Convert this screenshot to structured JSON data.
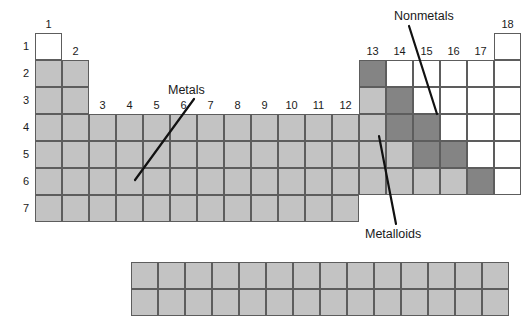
{
  "diagram": {
    "colors": {
      "metal": "#c3c3c3",
      "metalloid": "#848484",
      "nonmetal": "#ffffff",
      "cell_border": "#5d5d5d",
      "leader_line": "#111111",
      "text": "#1a1a1a",
      "background": "#ffffff"
    }
  },
  "geometry": {
    "cell_size": 27,
    "origin_x": 35,
    "origin_y": 33,
    "fblock_origin_x": 131,
    "fblock_origin_y": 262,
    "fblock_columns": 14,
    "fblock_rows": 2
  },
  "group_labels": [
    "1",
    "2",
    "3",
    "4",
    "5",
    "6",
    "7",
    "8",
    "9",
    "10",
    "11",
    "12",
    "13",
    "14",
    "15",
    "16",
    "17",
    "18"
  ],
  "period_labels": [
    "1",
    "2",
    "3",
    "4",
    "5",
    "6",
    "7"
  ],
  "callouts": [
    {
      "id": "metals",
      "label": "Metals",
      "label_x": 168,
      "label_y": 84,
      "line_x1": 194,
      "line_y1": 99,
      "line_x2": 135,
      "line_y2": 180
    },
    {
      "id": "nonmetals",
      "label": "Nonmetals",
      "label_x": 394,
      "label_y": 10,
      "line_x1": 409,
      "line_y1": 26,
      "line_x2": 437,
      "line_y2": 114
    },
    {
      "id": "metalloids",
      "label": "Metalloids",
      "label_x": 365,
      "label_y": 228,
      "line_x1": 396,
      "line_y1": 224,
      "line_x2": 379,
      "line_y2": 136
    }
  ],
  "main_grid": {
    "rows": [
      {
        "period": "1",
        "cells": [
          {
            "group": 1,
            "type": "nonmetal"
          },
          {
            "group": 18,
            "type": "nonmetal"
          }
        ]
      },
      {
        "period": "2",
        "cells": [
          {
            "group": 1,
            "type": "metal"
          },
          {
            "group": 2,
            "type": "metal"
          },
          {
            "group": 13,
            "type": "metalloid"
          },
          {
            "group": 14,
            "type": "nonmetal"
          },
          {
            "group": 15,
            "type": "nonmetal"
          },
          {
            "group": 16,
            "type": "nonmetal"
          },
          {
            "group": 17,
            "type": "nonmetal"
          },
          {
            "group": 18,
            "type": "nonmetal"
          }
        ]
      },
      {
        "period": "3",
        "cells": [
          {
            "group": 1,
            "type": "metal"
          },
          {
            "group": 2,
            "type": "metal"
          },
          {
            "group": 13,
            "type": "metal"
          },
          {
            "group": 14,
            "type": "metalloid"
          },
          {
            "group": 15,
            "type": "nonmetal"
          },
          {
            "group": 16,
            "type": "nonmetal"
          },
          {
            "group": 17,
            "type": "nonmetal"
          },
          {
            "group": 18,
            "type": "nonmetal"
          }
        ]
      },
      {
        "period": "4",
        "cells": [
          {
            "group": 1,
            "type": "metal"
          },
          {
            "group": 2,
            "type": "metal"
          },
          {
            "group": 3,
            "type": "metal"
          },
          {
            "group": 4,
            "type": "metal"
          },
          {
            "group": 5,
            "type": "metal"
          },
          {
            "group": 6,
            "type": "metal"
          },
          {
            "group": 7,
            "type": "metal"
          },
          {
            "group": 8,
            "type": "metal"
          },
          {
            "group": 9,
            "type": "metal"
          },
          {
            "group": 10,
            "type": "metal"
          },
          {
            "group": 11,
            "type": "metal"
          },
          {
            "group": 12,
            "type": "metal"
          },
          {
            "group": 13,
            "type": "metal"
          },
          {
            "group": 14,
            "type": "metalloid"
          },
          {
            "group": 15,
            "type": "metalloid"
          },
          {
            "group": 16,
            "type": "nonmetal"
          },
          {
            "group": 17,
            "type": "nonmetal"
          },
          {
            "group": 18,
            "type": "nonmetal"
          }
        ]
      },
      {
        "period": "5",
        "cells": [
          {
            "group": 1,
            "type": "metal"
          },
          {
            "group": 2,
            "type": "metal"
          },
          {
            "group": 3,
            "type": "metal"
          },
          {
            "group": 4,
            "type": "metal"
          },
          {
            "group": 5,
            "type": "metal"
          },
          {
            "group": 6,
            "type": "metal"
          },
          {
            "group": 7,
            "type": "metal"
          },
          {
            "group": 8,
            "type": "metal"
          },
          {
            "group": 9,
            "type": "metal"
          },
          {
            "group": 10,
            "type": "metal"
          },
          {
            "group": 11,
            "type": "metal"
          },
          {
            "group": 12,
            "type": "metal"
          },
          {
            "group": 13,
            "type": "metal"
          },
          {
            "group": 14,
            "type": "metal"
          },
          {
            "group": 15,
            "type": "metalloid"
          },
          {
            "group": 16,
            "type": "metalloid"
          },
          {
            "group": 17,
            "type": "nonmetal"
          },
          {
            "group": 18,
            "type": "nonmetal"
          }
        ]
      },
      {
        "period": "6",
        "cells": [
          {
            "group": 1,
            "type": "metal"
          },
          {
            "group": 2,
            "type": "metal"
          },
          {
            "group": 3,
            "type": "metal"
          },
          {
            "group": 4,
            "type": "metal"
          },
          {
            "group": 5,
            "type": "metal"
          },
          {
            "group": 6,
            "type": "metal"
          },
          {
            "group": 7,
            "type": "metal"
          },
          {
            "group": 8,
            "type": "metal"
          },
          {
            "group": 9,
            "type": "metal"
          },
          {
            "group": 10,
            "type": "metal"
          },
          {
            "group": 11,
            "type": "metal"
          },
          {
            "group": 12,
            "type": "metal"
          },
          {
            "group": 13,
            "type": "metal"
          },
          {
            "group": 14,
            "type": "metal"
          },
          {
            "group": 15,
            "type": "metal"
          },
          {
            "group": 16,
            "type": "metal"
          },
          {
            "group": 17,
            "type": "metalloid"
          },
          {
            "group": 18,
            "type": "nonmetal"
          }
        ]
      },
      {
        "period": "7",
        "cells": [
          {
            "group": 1,
            "type": "metal"
          },
          {
            "group": 2,
            "type": "metal"
          },
          {
            "group": 3,
            "type": "metal"
          },
          {
            "group": 4,
            "type": "metal"
          },
          {
            "group": 5,
            "type": "metal"
          },
          {
            "group": 6,
            "type": "metal"
          },
          {
            "group": 7,
            "type": "metal"
          },
          {
            "group": 8,
            "type": "metal"
          },
          {
            "group": 9,
            "type": "metal"
          },
          {
            "group": 10,
            "type": "metal"
          },
          {
            "group": 11,
            "type": "metal"
          },
          {
            "group": 12,
            "type": "metal"
          }
        ]
      }
    ]
  },
  "fblock": {
    "type": "metal",
    "rows": [
      {
        "cells": [
          "metal",
          "metal",
          "metal",
          "metal",
          "metal",
          "metal",
          "metal",
          "metal",
          "metal",
          "metal",
          "metal",
          "metal",
          "metal",
          "metal"
        ]
      },
      {
        "cells": [
          "metal",
          "metal",
          "metal",
          "metal",
          "metal",
          "metal",
          "metal",
          "metal",
          "metal",
          "metal",
          "metal",
          "metal",
          "metal",
          "metal"
        ]
      }
    ]
  },
  "group_label_positions": [
    {
      "group": 1,
      "row_above": 1
    },
    {
      "group": 2,
      "row_above": 2
    },
    {
      "group": 3,
      "row_above": 4
    },
    {
      "group": 4,
      "row_above": 4
    },
    {
      "group": 5,
      "row_above": 4
    },
    {
      "group": 6,
      "row_above": 4
    },
    {
      "group": 7,
      "row_above": 4
    },
    {
      "group": 8,
      "row_above": 4
    },
    {
      "group": 9,
      "row_above": 4
    },
    {
      "group": 10,
      "row_above": 4
    },
    {
      "group": 11,
      "row_above": 4
    },
    {
      "group": 12,
      "row_above": 4
    },
    {
      "group": 13,
      "row_above": 2
    },
    {
      "group": 14,
      "row_above": 2
    },
    {
      "group": 15,
      "row_above": 2
    },
    {
      "group": 16,
      "row_above": 2
    },
    {
      "group": 17,
      "row_above": 2
    },
    {
      "group": 18,
      "row_above": 1
    }
  ]
}
